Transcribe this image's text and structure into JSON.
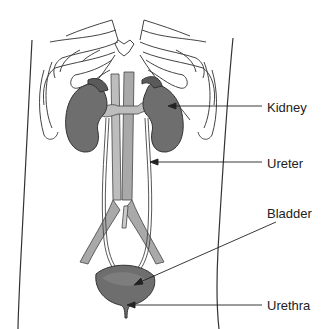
{
  "diagram": {
    "colors": {
      "outline": "#333333",
      "organ_fill": "#6e6e6e",
      "organ_dark": "#5a5a5a",
      "vessel_fill": "#a9a9a9",
      "vein_fill": "#bdbdbd",
      "background": "#ffffff"
    },
    "labels": [
      {
        "id": "kidney",
        "text": "Kidney",
        "x": 267,
        "y": 101
      },
      {
        "id": "ureter",
        "text": "Ureter",
        "x": 267,
        "y": 157
      },
      {
        "id": "bladder",
        "text": "Bladder",
        "x": 267,
        "y": 207
      },
      {
        "id": "urethra",
        "text": "Urethra",
        "x": 267,
        "y": 299
      }
    ]
  }
}
